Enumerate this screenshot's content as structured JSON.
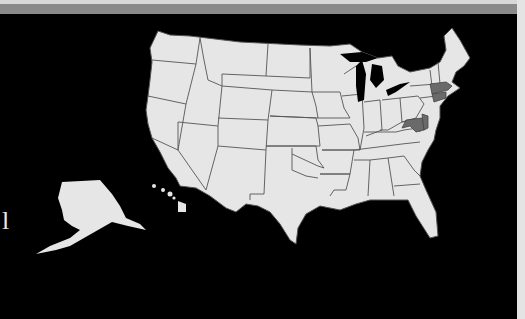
{
  "map": {
    "title": "",
    "region": "United States",
    "fill_color": "#e6e6e6",
    "border_color": "#555555",
    "background_color": "#000000",
    "highlight_color": "#6a6a6a",
    "highlighted_states": [
      "Massachusetts",
      "Connecticut",
      "Rhode Island",
      "Maryland",
      "Delaware"
    ],
    "insets": [
      "Alaska",
      "Hawaii"
    ]
  },
  "side_label": "l"
}
